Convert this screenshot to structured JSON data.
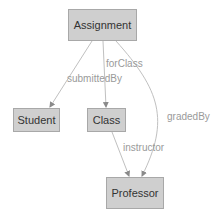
{
  "diagram": {
    "type": "class-relationship-graph",
    "colors": {
      "node_fill": "#cfcfcf",
      "node_border": "#a8a8a8",
      "node_text": "#333333",
      "edge": "#b0b0b0",
      "edge_label": "#9a9a9a"
    },
    "nodes": [
      {
        "id": "assignment",
        "label": "Assignment"
      },
      {
        "id": "student",
        "label": "Student"
      },
      {
        "id": "class",
        "label": "Class"
      },
      {
        "id": "professor",
        "label": "Professor"
      }
    ],
    "edges": [
      {
        "from": "assignment",
        "to": "student",
        "label": "submittedBy"
      },
      {
        "from": "assignment",
        "to": "class",
        "label": "forClass"
      },
      {
        "from": "assignment",
        "to": "professor",
        "label": "gradedBy"
      },
      {
        "from": "class",
        "to": "professor",
        "label": "instructor"
      }
    ]
  }
}
